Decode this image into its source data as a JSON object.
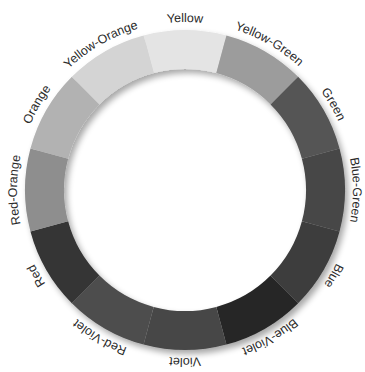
{
  "diagram": {
    "type": "color-wheel",
    "center": [
      185,
      190
    ],
    "outer_radius": 160,
    "inner_radius": 121,
    "label_radius": 168,
    "segments": [
      {
        "label": "Yellow",
        "color": "#e4e4e4"
      },
      {
        "label": "Yellow-Green",
        "color": "#9c9c9c"
      },
      {
        "label": "Green",
        "color": "#555555"
      },
      {
        "label": "Blue-Green",
        "color": "#474747"
      },
      {
        "label": "Blue",
        "color": "#3e3e3e"
      },
      {
        "label": "Blue-Violet",
        "color": "#262626"
      },
      {
        "label": "Violet",
        "color": "#474747"
      },
      {
        "label": "Red-Violet",
        "color": "#4e4e4e"
      },
      {
        "label": "Red",
        "color": "#343434"
      },
      {
        "label": "Red-Orange",
        "color": "#8e8e8e"
      },
      {
        "label": "Orange",
        "color": "#b2b2b2"
      },
      {
        "label": "Yellow-Orange",
        "color": "#d4d4d4"
      }
    ]
  }
}
